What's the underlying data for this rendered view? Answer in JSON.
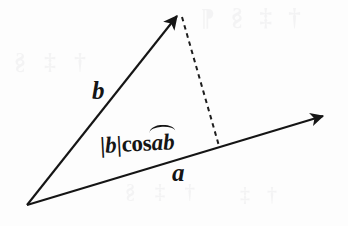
{
  "figure": {
    "background_color": "#fdfdfd",
    "ink_color": "#151515",
    "width": 348,
    "height": 226
  },
  "geometry": {
    "origin": {
      "x": 27,
      "y": 205
    },
    "vector_a": {
      "name": "a",
      "start": {
        "x": 27,
        "y": 205
      },
      "end": {
        "x": 327,
        "y": 114
      },
      "style": "solid",
      "arrowhead": true
    },
    "vector_b": {
      "name": "b",
      "start": {
        "x": 27,
        "y": 205
      },
      "end": {
        "x": 180,
        "y": 12
      },
      "style": "solid",
      "arrowhead": true
    },
    "projection_drop": {
      "name": "perpendicular-drop",
      "start": {
        "x": 181,
        "y": 15
      },
      "end": {
        "x": 219,
        "y": 146
      },
      "style": "dashed",
      "arrowhead": false
    }
  },
  "labels": {
    "vector_a": "a",
    "vector_b": "b",
    "projection": {
      "magnitude_bars_open": "|",
      "vector_inside_bars": "b",
      "magnitude_bars_close": "|",
      "function": "cos",
      "angle_first": "a",
      "angle_second": "b",
      "full_text": "|b|cos ab"
    }
  },
  "ghost_text": {
    "note": "faint bleed-through from reverse side of page",
    "lines": [
      "† ‡ § ¶",
      "† ‡ §",
      "† ‡ §",
      "† ‡"
    ]
  }
}
